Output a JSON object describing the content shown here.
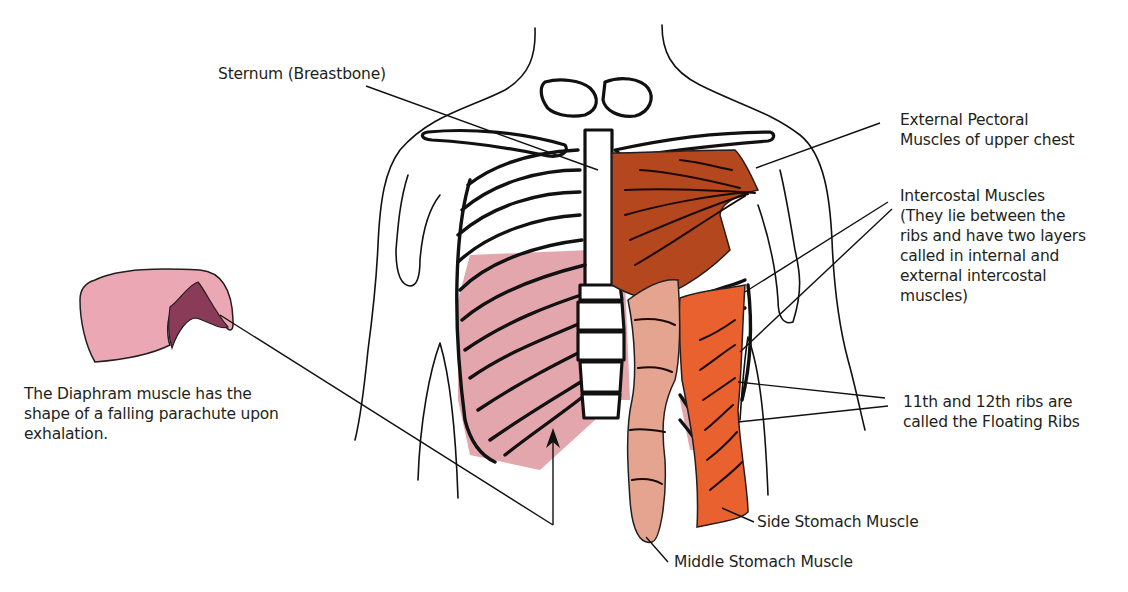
{
  "diagram": {
    "colors": {
      "background": "#ffffff",
      "line": "#111111",
      "pectoral": "#b5471e",
      "side_stomach": "#e8612f",
      "middle_stomach": "#e4a48f",
      "intercostal_pink": "#e4a6ad",
      "diaphragm_light": "#eba8b4",
      "diaphragm_dark": "#8a3b57"
    },
    "labels": {
      "sternum": {
        "lines": [
          "Sternum (Breastbone)"
        ]
      },
      "pectoral": {
        "lines": [
          "External Pectoral",
          "Muscles of upper chest"
        ]
      },
      "intercostal": {
        "lines": [
          "Intercostal Muscles",
          "(They lie between the",
          "ribs and have two layers",
          "called in internal and",
          "external intercostal",
          "muscles)"
        ]
      },
      "floating_ribs": {
        "lines": [
          "11th and 12th ribs are",
          "called the Floating Ribs"
        ]
      },
      "side_stomach": {
        "lines": [
          "Side Stomach Muscle"
        ]
      },
      "middle_stomach": {
        "lines": [
          "Middle Stomach Muscle"
        ]
      },
      "diaphragm": {
        "lines": [
          "The Diaphram muscle has the",
          "shape of a falling parachute upon",
          "exhalation."
        ]
      }
    }
  }
}
